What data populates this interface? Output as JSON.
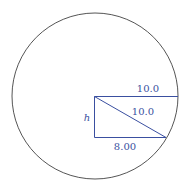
{
  "diagram": {
    "colors": {
      "circle": "#555555",
      "figure": "#3a4fa0",
      "background": "#ffffff"
    },
    "circle": {
      "cx": 95,
      "cy": 96,
      "r": 83
    },
    "labels": {
      "radius_top": "10.0",
      "hypotenuse": "10.0",
      "base": "8.00",
      "height": "h"
    }
  }
}
